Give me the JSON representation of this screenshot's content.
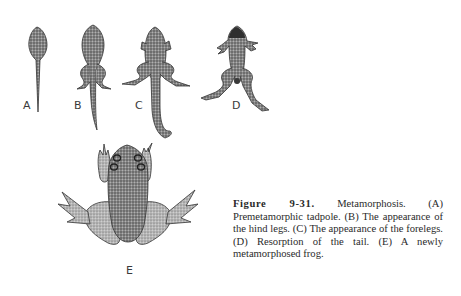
{
  "figure": {
    "number": "Figure 9-31.",
    "caption_text": " Metamorphosis. (A) Premetamorphic tadpole. (B) The appearance of the hind legs. (C) The appearance of the forelegs. (D) Resorption of the tail. (E) A newly metamorphosed frog.",
    "caption_lines": [
      "Figure 9-31. Metamorphosis. (A) Pre-",
      "metamorphic tadpole. (B) The appear-",
      "ance of the hind legs. (C) The appearance",
      "of the forelegs. (D) Resorption of the tail.",
      "(E) A newly metamorphosed frog."
    ],
    "stages": [
      {
        "label": "A",
        "description": "Premetamorphic tadpole"
      },
      {
        "label": "B",
        "description": "The appearance of the hind legs"
      },
      {
        "label": "C",
        "description": "The appearance of the forelegs"
      },
      {
        "label": "D",
        "description": "Resorption of the tail"
      },
      {
        "label": "E",
        "description": "A newly metamorphosed frog"
      }
    ],
    "colors": {
      "ink": "#3a3a3a",
      "stipple_dark": "#555555",
      "stipple_light": "#9a9a9a",
      "background": "#ffffff"
    }
  }
}
